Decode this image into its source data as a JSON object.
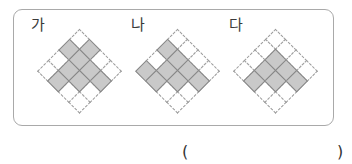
{
  "options": [
    {
      "label": "가",
      "grid_size": 4,
      "shaded_cells": [
        [
          0,
          1
        ],
        [
          1,
          0
        ],
        [
          1,
          1
        ],
        [
          1,
          2
        ],
        [
          1,
          3
        ],
        [
          2,
          1
        ],
        [
          2,
          2
        ],
        [
          3,
          1
        ]
      ],
      "shaded_count": 8
    },
    {
      "label": "나",
      "grid_size": 4,
      "shaded_cells": [
        [
          1,
          0
        ],
        [
          1,
          1
        ],
        [
          1,
          2
        ],
        [
          1,
          3
        ],
        [
          2,
          1
        ],
        [
          2,
          2
        ],
        [
          3,
          0
        ],
        [
          3,
          1
        ]
      ],
      "shaded_count": 8
    },
    {
      "label": "다",
      "grid_size": 4,
      "shaded_cells": [
        [
          1,
          1
        ],
        [
          1,
          2
        ],
        [
          1,
          3
        ],
        [
          2,
          1
        ],
        [
          2,
          2
        ],
        [
          3,
          1
        ]
      ],
      "shaded_count": 6
    }
  ],
  "answer": {
    "open_paren": "(",
    "value": "",
    "close_paren": ")"
  },
  "colors": {
    "shaded_fill": "#c9c9c9",
    "shaded_border": "#858585",
    "empty_border": "#9a9a9a",
    "box_border": "#a9a9a9"
  }
}
